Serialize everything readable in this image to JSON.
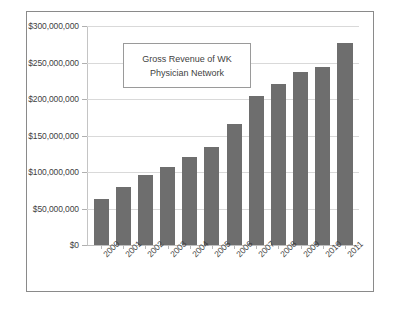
{
  "chart_data": {
    "type": "bar",
    "title": "Gross Revenue of WK Physician Network",
    "title_lines": [
      "Gross Revenue of WK",
      "Physician Network"
    ],
    "xlabel": "",
    "ylabel": "",
    "categories": [
      "2000",
      "2001",
      "2002",
      "2003",
      "2004",
      "2005",
      "2006",
      "2007",
      "2008",
      "2009",
      "2010",
      "2011"
    ],
    "values": [
      63000000,
      80000000,
      96000000,
      107000000,
      121000000,
      134000000,
      166000000,
      204000000,
      220000000,
      237000000,
      244000000,
      277000000
    ],
    "ylim": [
      0,
      300000000
    ],
    "ytick_values": [
      0,
      50000000,
      100000000,
      150000000,
      200000000,
      250000000,
      300000000
    ],
    "ytick_labels": [
      "$0",
      "$50,000,000",
      "$100,000,000",
      "$150,000,000",
      "$200,000,000",
      "$250,000,000",
      "$300,000,000"
    ],
    "grid": true,
    "legend": "none",
    "bar_color": "#6e6e6e",
    "gridline_color": "#d9d9d9",
    "frame_color": "#8a8a8a",
    "background_color": "#ffffff"
  }
}
